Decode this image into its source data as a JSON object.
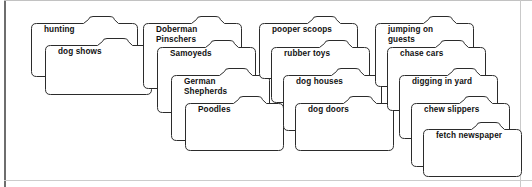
{
  "page": {
    "background_color": "#ffffff",
    "border_color": "#6e6e6e",
    "folder_outline_color": "#2b2b2b",
    "folder_fill_color": "#ffffff",
    "label_color": "#111111"
  },
  "columns": [
    {
      "name": "column-1",
      "folders": [
        {
          "label": "hunting",
          "x": 31,
          "y": 16,
          "w": 106,
          "h": 60,
          "tab_start": 52,
          "tab_end": 82
        },
        {
          "label": "dog shows",
          "x": 45,
          "y": 38,
          "w": 106,
          "h": 56,
          "tab_start": 52,
          "tab_end": 82
        }
      ]
    },
    {
      "name": "column-2",
      "folders": [
        {
          "label": "Doberman\nPinschers",
          "x": 143,
          "y": 16,
          "w": 98,
          "h": 72,
          "tab_start": 48,
          "tab_end": 76
        },
        {
          "label": "Samoyeds",
          "x": 157,
          "y": 40,
          "w": 98,
          "h": 72,
          "tab_start": 48,
          "tab_end": 76
        },
        {
          "label": "German\nShepherds",
          "x": 171,
          "y": 68,
          "w": 98,
          "h": 72,
          "tab_start": 48,
          "tab_end": 76
        },
        {
          "label": "Poodles",
          "x": 185,
          "y": 96,
          "w": 98,
          "h": 54,
          "tab_start": 48,
          "tab_end": 76
        }
      ]
    },
    {
      "name": "column-3",
      "folders": [
        {
          "label": "pooper scoops",
          "x": 259,
          "y": 16,
          "w": 98,
          "h": 62,
          "tab_start": 48,
          "tab_end": 76
        },
        {
          "label": "rubber toys",
          "x": 271,
          "y": 40,
          "w": 98,
          "h": 62,
          "tab_start": 48,
          "tab_end": 76
        },
        {
          "label": "dog houses",
          "x": 283,
          "y": 68,
          "w": 98,
          "h": 62,
          "tab_start": 48,
          "tab_end": 76
        },
        {
          "label": "dog doors",
          "x": 295,
          "y": 96,
          "w": 98,
          "h": 54,
          "tab_start": 48,
          "tab_end": 76
        }
      ]
    },
    {
      "name": "column-4",
      "folders": [
        {
          "label": "jumping on\nguests",
          "x": 375,
          "y": 16,
          "w": 98,
          "h": 70,
          "tab_start": 48,
          "tab_end": 76
        },
        {
          "label": "chase cars",
          "x": 387,
          "y": 40,
          "w": 98,
          "h": 70,
          "tab_start": 48,
          "tab_end": 76
        },
        {
          "label": "digging in yard",
          "x": 399,
          "y": 68,
          "w": 98,
          "h": 70,
          "tab_start": 48,
          "tab_end": 76
        },
        {
          "label": "chew slippers",
          "x": 411,
          "y": 96,
          "w": 98,
          "h": 70,
          "tab_start": 48,
          "tab_end": 76
        },
        {
          "label": "fetch newspaper",
          "x": 423,
          "y": 122,
          "w": 98,
          "h": 54,
          "tab_start": 48,
          "tab_end": 76
        }
      ]
    }
  ]
}
